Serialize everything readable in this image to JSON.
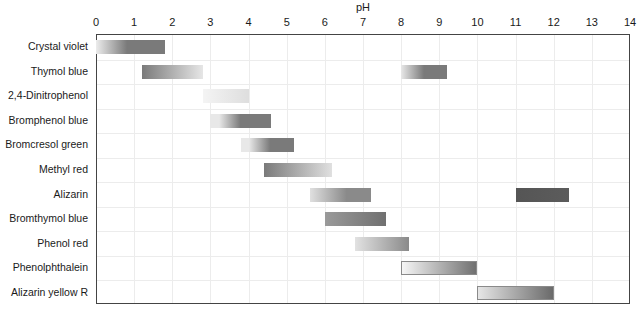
{
  "chart_data": {
    "type": "bar",
    "subtype": "floating-range (indicator transition ranges)",
    "title": "",
    "xlabel": "pH",
    "ylabel": "",
    "xlim": [
      0,
      14
    ],
    "x_ticks": [
      "0",
      "1",
      "2",
      "3",
      "4",
      "5",
      "6",
      "7",
      "8",
      "9",
      "10",
      "11",
      "12",
      "13",
      "14"
    ],
    "x_axis_position": "top",
    "grid": true,
    "legend": null,
    "categories": [
      "Crystal violet",
      "Thymol blue",
      "2,4-Dinitrophenol",
      "Bromphenol blue",
      "Bromcresol green",
      "Methyl red",
      "Alizarin",
      "Bromthymol blue",
      "Phenol red",
      "Phenolphthalein",
      "Alizarin yellow R"
    ],
    "ranges": [
      [
        {
          "start": 0.0,
          "end": 1.8,
          "gradient": [
            "#ececec",
            "#7a7a7a"
          ],
          "stops": [
            0,
            45
          ]
        }
      ],
      [
        {
          "start": 1.2,
          "end": 2.8,
          "gradient": [
            "#7a7a7a",
            "#e6e6e6"
          ],
          "stops": [
            0,
            100
          ]
        },
        {
          "start": 8.0,
          "end": 9.2,
          "gradient": [
            "#e8e8e8",
            "#7a7a7a"
          ],
          "stops": [
            0,
            50
          ]
        }
      ],
      [
        {
          "start": 2.8,
          "end": 4.0,
          "gradient": [
            "#f4f4f4",
            "#dedede"
          ],
          "stops": [
            0,
            100
          ]
        }
      ],
      [
        {
          "start": 3.0,
          "end": 4.6,
          "gradient": [
            "#e8e8e8",
            "#7a7a7a"
          ],
          "stops": [
            15,
            50
          ]
        }
      ],
      [
        {
          "start": 3.8,
          "end": 5.2,
          "gradient": [
            "#e8e8e8",
            "#7a7a7a"
          ],
          "stops": [
            15,
            55
          ]
        }
      ],
      [
        {
          "start": 4.4,
          "end": 6.2,
          "gradient": [
            "#7a7a7a",
            "#e0e0e0"
          ],
          "stops": [
            0,
            100
          ]
        }
      ],
      [
        {
          "start": 5.6,
          "end": 7.2,
          "gradient": [
            "#e0e0e0",
            "#8a8a8a"
          ],
          "stops": [
            0,
            60
          ]
        },
        {
          "start": 11.0,
          "end": 12.4,
          "gradient": [
            "#555555",
            "#5c5c5c"
          ],
          "stops": [
            0,
            100
          ]
        }
      ],
      [
        {
          "start": 6.0,
          "end": 7.6,
          "gradient": [
            "#9a9a9a",
            "#707070"
          ],
          "stops": [
            0,
            100
          ]
        }
      ],
      [
        {
          "start": 6.8,
          "end": 8.2,
          "gradient": [
            "#e2e2e2",
            "#8a8a8a"
          ],
          "stops": [
            0,
            100
          ]
        }
      ],
      [
        {
          "start": 8.0,
          "end": 10.0,
          "gradient": [
            "#f6f6f6",
            "#707070"
          ],
          "stops": [
            0,
            100
          ],
          "outlined": true
        }
      ],
      [
        {
          "start": 10.0,
          "end": 12.0,
          "gradient": [
            "#e6e6e6",
            "#6a6a6a"
          ],
          "stops": [
            0,
            100
          ],
          "outlined": true
        }
      ]
    ]
  }
}
